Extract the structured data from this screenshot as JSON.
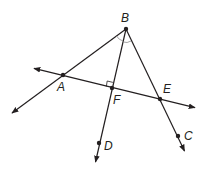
{
  "diagram": {
    "stroke_color": "#231f20",
    "arc_color": "#9a9a9a",
    "points": [
      {
        "id": "B",
        "label": "B",
        "x": 126,
        "y": 29,
        "lx": 121,
        "ly": 22
      },
      {
        "id": "A",
        "label": "A",
        "x": 63,
        "y": 75,
        "lx": 57,
        "ly": 91
      },
      {
        "id": "F",
        "label": "F",
        "x": 112,
        "y": 88,
        "lx": 113,
        "ly": 104
      },
      {
        "id": "E",
        "label": "E",
        "x": 160,
        "y": 99,
        "lx": 163,
        "ly": 93
      },
      {
        "id": "D",
        "label": "D",
        "x": 99,
        "y": 143,
        "lx": 104,
        "ly": 150
      },
      {
        "id": "C",
        "label": "C",
        "x": 178,
        "y": 136,
        "lx": 184,
        "ly": 140
      }
    ],
    "lines": [
      {
        "name": "ray-BA",
        "from": "B",
        "to_x": 11,
        "to_y": 114,
        "arrow": "end"
      },
      {
        "name": "ray-BD",
        "from": "B",
        "to_x": 95,
        "to_y": 163,
        "arrow": "end"
      },
      {
        "name": "ray-BC",
        "from": "B",
        "to_x": 185,
        "to_y": 152,
        "arrow": "end"
      },
      {
        "name": "line-AE",
        "from_x": 33,
        "from_y": 68,
        "to_x": 196,
        "to_y": 108,
        "arrow": "both"
      }
    ],
    "marks": {
      "right_angle_at": "F",
      "angle_arcs_at": "B"
    }
  }
}
